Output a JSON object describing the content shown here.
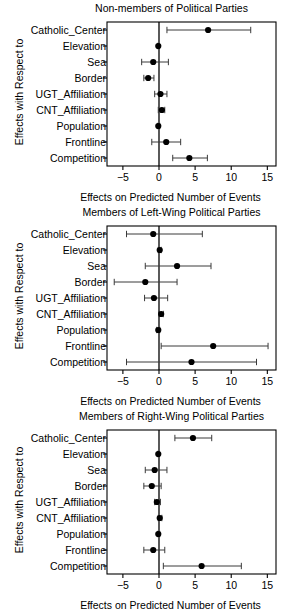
{
  "figure": {
    "panel_count": 3,
    "shared_ylabel": "Effects with Respect to",
    "shared_xlabel": "Effects on Predicted Number of Events",
    "point_color": "#000000",
    "line_color": "#3a3a3a",
    "axis_color": "#000000",
    "background": "#ffffff"
  },
  "chart_data": [
    {
      "type": "scatter",
      "title": "Non-members of Political Parties",
      "xlabel": "Effects on Predicted Number of Events",
      "ylabel": "Effects with Respect to",
      "xlim": [
        -7.2,
        16.2
      ],
      "xticks": [
        -5,
        0,
        5,
        10,
        15
      ],
      "xticklabels": [
        "−5",
        "0",
        "5",
        "10",
        "15"
      ],
      "grid": false,
      "reference_line": 0,
      "orientation": "horizontal",
      "categories": [
        "Catholic_Center",
        "Elevation",
        "Sea",
        "Border",
        "UGT_Affiliation",
        "CNT_Affiliation",
        "Population",
        "Frontline",
        "Competition"
      ],
      "values": [
        6.8,
        -0.1,
        -0.8,
        -1.5,
        0.2,
        0.4,
        -0.1,
        1.0,
        4.2
      ],
      "ci_low": [
        1.1,
        -0.2,
        -2.4,
        -2.1,
        -0.6,
        -0.1,
        -0.2,
        -1.0,
        1.9
      ],
      "ci_high": [
        12.7,
        0.0,
        1.3,
        -0.7,
        1.1,
        0.8,
        0.1,
        3.0,
        6.7
      ]
    },
    {
      "type": "scatter",
      "title": "Members of Left-Wing Political Parties",
      "xlabel": "Effects on Predicted Number of Events",
      "ylabel": "Effects with Respect to",
      "xlim": [
        -7.2,
        16.2
      ],
      "xticks": [
        -5,
        0,
        5,
        10,
        15
      ],
      "xticklabels": [
        "−5",
        "0",
        "5",
        "10",
        "15"
      ],
      "grid": false,
      "reference_line": 0,
      "orientation": "horizontal",
      "categories": [
        "Catholic_Center",
        "Elevation",
        "Sea",
        "Border",
        "UGT_Affiliation",
        "CNT_Affiliation",
        "Population",
        "Frontline",
        "Competition"
      ],
      "values": [
        -0.8,
        0.1,
        2.5,
        -1.9,
        -0.7,
        0.3,
        -0.1,
        7.5,
        4.5
      ],
      "ci_low": [
        -4.5,
        -0.1,
        -1.9,
        -6.2,
        -2.0,
        0.0,
        -0.3,
        0.3,
        -4.5
      ],
      "ci_high": [
        6.0,
        0.3,
        7.2,
        2.5,
        1.2,
        0.6,
        0.1,
        15.1,
        13.5
      ]
    },
    {
      "type": "scatter",
      "title": "Members of Right-Wing Political Parties",
      "xlabel": "Effects on Predicted Number of Events",
      "ylabel": "Effects with Respect to",
      "xlim": [
        -7.2,
        16.2
      ],
      "xticks": [
        -5,
        0,
        5,
        10,
        15
      ],
      "xticklabels": [
        "−5",
        "0",
        "5",
        "10",
        "15"
      ],
      "grid": false,
      "reference_line": 0,
      "orientation": "horizontal",
      "categories": [
        "Catholic_Center",
        "Elevation",
        "Sea",
        "Border",
        "UGT_Affiliation",
        "CNT_Affiliation",
        "Population",
        "Frontline",
        "Competition"
      ],
      "values": [
        4.7,
        -0.1,
        -0.6,
        -1.0,
        -0.3,
        0.1,
        -0.1,
        -0.8,
        5.9
      ],
      "ci_low": [
        2.2,
        -0.2,
        -1.9,
        -2.1,
        -0.6,
        -0.1,
        -0.2,
        -2.1,
        0.6
      ],
      "ci_high": [
        7.3,
        0.0,
        1.1,
        0.3,
        0.2,
        0.4,
        0.1,
        0.8,
        11.4
      ]
    }
  ]
}
